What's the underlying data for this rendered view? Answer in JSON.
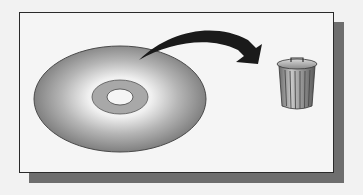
{
  "illustration": {
    "subject": "disc being discarded into trash can",
    "elements": {
      "disc": {
        "icon": "optical-disc-icon"
      },
      "arrow": {
        "icon": "curved-arrow-icon"
      },
      "trash": {
        "icon": "trash-can-icon"
      }
    },
    "colors": {
      "background": "#f2f2f2",
      "frame_fill": "#f5f5f5",
      "frame_border": "#2a2a2a",
      "shadow": "#6e6e6e",
      "disc_edge": "#7a7a7a",
      "disc_highlight": "#f4f4f4",
      "hub": "#a8a8a8",
      "arrow": "#1a1a1a",
      "trash": "#8a8a8a"
    }
  }
}
